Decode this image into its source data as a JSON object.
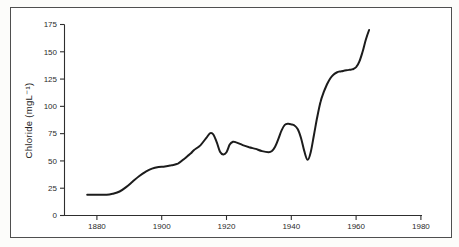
{
  "figure": {
    "border_color": "#4f4f4f",
    "background": "#ffffff"
  },
  "chart_data": {
    "type": "line",
    "title": "",
    "xlabel": "",
    "ylabel": "Chloride (mgL⁻¹)",
    "x_ticks": [
      "1880",
      "1900",
      "1920",
      "1940",
      "1960",
      "1980"
    ],
    "y_ticks": [
      "0",
      "25",
      "50",
      "75",
      "100",
      "125",
      "150",
      "175"
    ],
    "xlim": [
      1870,
      1981
    ],
    "ylim": [
      0,
      175
    ],
    "grid": false,
    "legend": "none",
    "line_color": "#1c1c1c",
    "series": [
      {
        "name": "chloride-concentration",
        "x": [
          1877,
          1880,
          1883,
          1885,
          1887,
          1889,
          1891,
          1893,
          1895,
          1897,
          1899,
          1901,
          1903,
          1905,
          1907,
          1908,
          1909,
          1910,
          1912,
          1914,
          1915,
          1916,
          1917,
          1918,
          1919,
          1920,
          1921,
          1922,
          1923,
          1925,
          1927,
          1929,
          1931,
          1933,
          1934,
          1935,
          1936,
          1937,
          1938,
          1939,
          1940,
          1941,
          1942,
          1943,
          1944,
          1945,
          1946,
          1947,
          1948,
          1949,
          1950,
          1951,
          1952,
          1953,
          1954,
          1955,
          1956,
          1957,
          1958,
          1959,
          1960,
          1961,
          1962,
          1963,
          1964
        ],
        "values": [
          19,
          19,
          19,
          20,
          22,
          26,
          31,
          36,
          40,
          43,
          44.5,
          45,
          46,
          47.5,
          52,
          54.5,
          57,
          60,
          64.5,
          72,
          75.5,
          74,
          67,
          58.5,
          56,
          58,
          65,
          67.5,
          67,
          64.5,
          62.5,
          61,
          59,
          58,
          59,
          63,
          70,
          78,
          83,
          84,
          83.5,
          82.5,
          79,
          71,
          59,
          51,
          58,
          74,
          90,
          104,
          113,
          120,
          125.5,
          129,
          131,
          132,
          132.5,
          133,
          133.5,
          134,
          136,
          141,
          150,
          161,
          170
        ]
      }
    ]
  }
}
